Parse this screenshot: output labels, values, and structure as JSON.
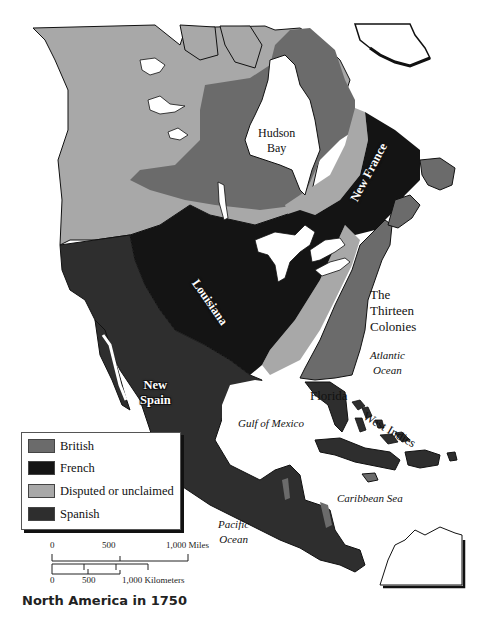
{
  "map": {
    "title": "North America in 1750",
    "labels": {
      "hudson_bay": "Hudson Bay",
      "hudson_bay_line1": "Hudson",
      "hudson_bay_line2": "Bay",
      "new_france": "New France",
      "louisiana": "Louisiana",
      "thirteen_colonies_line1": "The",
      "thirteen_colonies_line2": "Thirteen",
      "thirteen_colonies_line3": "Colonies",
      "atlantic_line1": "Atlantic",
      "atlantic_line2": "Ocean",
      "new_spain_line1": "New",
      "new_spain_line2": "Spain",
      "florida": "Florida",
      "west_indies": "West Indies",
      "gulf_of_mexico": "Gulf of Mexico",
      "caribbean_sea": "Caribbean Sea",
      "pacific_line1": "Pacific",
      "pacific_line2": "Ocean"
    },
    "colors": {
      "british": "#6b6b6b",
      "french": "#141414",
      "disputed": "#a8a8a8",
      "spanish": "#2e2e2e",
      "water": "#ffffff",
      "outline": "#111111"
    }
  },
  "legend": {
    "items": [
      {
        "label": "British",
        "color": "#6b6b6b"
      },
      {
        "label": "French",
        "color": "#141414"
      },
      {
        "label": "Disputed or unclaimed",
        "color": "#a8a8a8"
      },
      {
        "label": "Spanish",
        "color": "#2e2e2e"
      }
    ]
  },
  "scale": {
    "miles": {
      "ticks": [
        "0",
        "500",
        "1,000 Miles"
      ]
    },
    "kilometers": {
      "ticks": [
        "0",
        "500",
        "1,000 Kilometers"
      ]
    }
  }
}
